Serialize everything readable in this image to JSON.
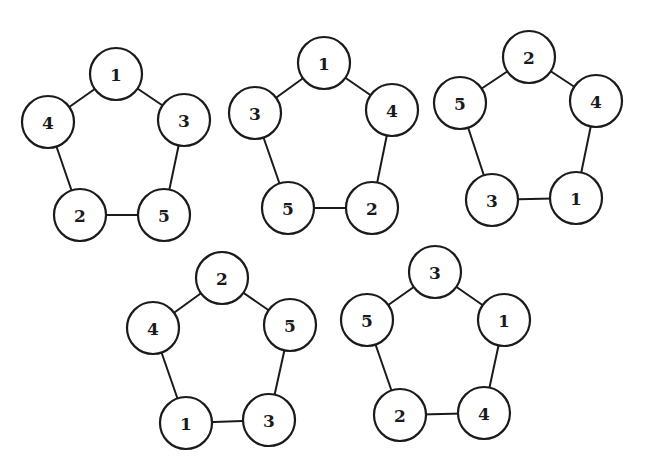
{
  "diagram": {
    "style": {
      "stroke_color": "#1a1a1a",
      "fill_color": "#ffffff",
      "background": "#ffffff",
      "node_radius": 26
    },
    "graphs": [
      {
        "id": "graph-1",
        "nodes": [
          {
            "label": "1",
            "x": 116,
            "y": 74
          },
          {
            "label": "3",
            "x": 184,
            "y": 120
          },
          {
            "label": "5",
            "x": 164,
            "y": 215
          },
          {
            "label": "2",
            "x": 80,
            "y": 215
          },
          {
            "label": "4",
            "x": 48,
            "y": 122
          }
        ],
        "edges": [
          [
            "1",
            "3"
          ],
          [
            "3",
            "5"
          ],
          [
            "5",
            "2"
          ],
          [
            "2",
            "4"
          ],
          [
            "4",
            "1"
          ]
        ]
      },
      {
        "id": "graph-2",
        "nodes": [
          {
            "label": "1",
            "x": 324,
            "y": 63
          },
          {
            "label": "4",
            "x": 392,
            "y": 110
          },
          {
            "label": "2",
            "x": 372,
            "y": 208
          },
          {
            "label": "5",
            "x": 288,
            "y": 208
          },
          {
            "label": "3",
            "x": 255,
            "y": 113
          }
        ],
        "edges": [
          [
            "1",
            "4"
          ],
          [
            "4",
            "2"
          ],
          [
            "2",
            "5"
          ],
          [
            "5",
            "3"
          ],
          [
            "3",
            "1"
          ]
        ]
      },
      {
        "id": "graph-3",
        "nodes": [
          {
            "label": "2",
            "x": 529,
            "y": 57
          },
          {
            "label": "4",
            "x": 596,
            "y": 101
          },
          {
            "label": "1",
            "x": 576,
            "y": 198
          },
          {
            "label": "3",
            "x": 492,
            "y": 200
          },
          {
            "label": "5",
            "x": 460,
            "y": 103
          }
        ],
        "edges": [
          [
            "2",
            "4"
          ],
          [
            "4",
            "1"
          ],
          [
            "1",
            "3"
          ],
          [
            "3",
            "5"
          ],
          [
            "5",
            "2"
          ]
        ]
      },
      {
        "id": "graph-4",
        "nodes": [
          {
            "label": "2",
            "x": 222,
            "y": 278
          },
          {
            "label": "5",
            "x": 290,
            "y": 325
          },
          {
            "label": "3",
            "x": 269,
            "y": 420
          },
          {
            "label": "1",
            "x": 186,
            "y": 423
          },
          {
            "label": "4",
            "x": 153,
            "y": 328
          }
        ],
        "edges": [
          [
            "2",
            "5"
          ],
          [
            "5",
            "3"
          ],
          [
            "3",
            "1"
          ],
          [
            "1",
            "4"
          ],
          [
            "4",
            "2"
          ]
        ]
      },
      {
        "id": "graph-5",
        "nodes": [
          {
            "label": "3",
            "x": 435,
            "y": 272
          },
          {
            "label": "1",
            "x": 504,
            "y": 320
          },
          {
            "label": "4",
            "x": 484,
            "y": 413
          },
          {
            "label": "2",
            "x": 400,
            "y": 415
          },
          {
            "label": "5",
            "x": 367,
            "y": 320
          }
        ],
        "edges": [
          [
            "3",
            "1"
          ],
          [
            "1",
            "4"
          ],
          [
            "4",
            "2"
          ],
          [
            "2",
            "5"
          ],
          [
            "5",
            "3"
          ]
        ]
      }
    ]
  }
}
